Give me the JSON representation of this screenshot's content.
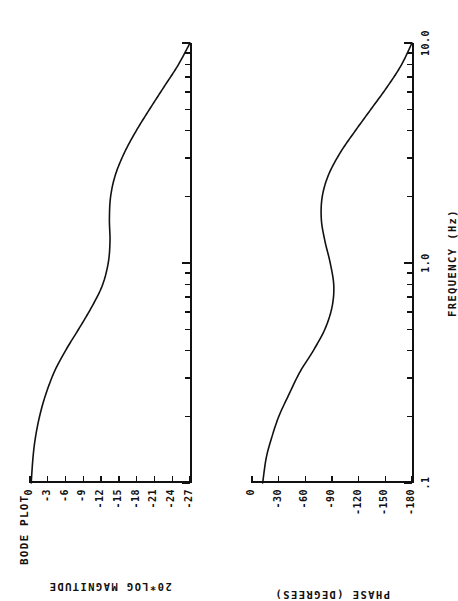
{
  "document": {
    "title": "BODE PLOT",
    "media": "dot-matrix-printout"
  },
  "axes": {
    "frequency": {
      "label": "FREQUENCY  (Hz)",
      "scale": "log",
      "tick_labels": [
        ".1",
        "1.0",
        "10.0"
      ],
      "tick_values": [
        0.1,
        1.0,
        10.0
      ],
      "range": [
        0.1,
        10.0
      ]
    },
    "magnitude": {
      "label": "20*LOG MAGNITUDE",
      "tick_labels": [
        "0",
        "-3",
        "-6",
        "-9",
        "-12",
        "-15",
        "-18",
        "-21",
        "-24",
        "-27"
      ],
      "tick_values": [
        0,
        -3,
        -6,
        -9,
        -12,
        -15,
        -18,
        -21,
        -24,
        -27
      ],
      "range": [
        0,
        -27
      ],
      "units": "dB"
    },
    "phase": {
      "label": "PHASE (DEGREES)",
      "tick_labels": [
        "0",
        "-30",
        "-60",
        "-90",
        "-120",
        "-150",
        "-180"
      ],
      "tick_values": [
        0,
        -30,
        -60,
        -90,
        -120,
        -150,
        -180
      ],
      "range": [
        0,
        -180
      ],
      "units": "degrees"
    }
  },
  "chart_data": [
    {
      "type": "line",
      "title": "BODE PLOT",
      "subtitle": "Magnitude response",
      "xlabel": "FREQUENCY  (Hz)",
      "ylabel": "20*LOG MAGNITUDE",
      "xscale": "log",
      "xlim": [
        0.1,
        10.0
      ],
      "ylim": [
        -27,
        0
      ],
      "grid": false,
      "legend": "none",
      "x": [
        0.1,
        0.13,
        0.16,
        0.2,
        0.25,
        0.32,
        0.4,
        0.5,
        0.63,
        0.79,
        1.0,
        1.26,
        1.58,
        2.0,
        2.51,
        3.16,
        3.98,
        5.01,
        6.31,
        7.94,
        10.0
      ],
      "values": [
        -0.2,
        -0.5,
        -0.9,
        -1.6,
        -2.6,
        -4.1,
        -6.0,
        -8.2,
        -10.4,
        -12.2,
        -13.2,
        -13.5,
        -13.4,
        -13.6,
        -14.4,
        -15.9,
        -17.9,
        -20.2,
        -22.6,
        -25.0,
        -27.0
      ]
    },
    {
      "type": "line",
      "title": "BODE PLOT",
      "subtitle": "Phase response",
      "xlabel": "FREQUENCY  (Hz)",
      "ylabel": "PHASE (DEGREES)",
      "xscale": "log",
      "xlim": [
        0.1,
        10.0
      ],
      "ylim": [
        -180,
        0
      ],
      "grid": false,
      "legend": "none",
      "x": [
        0.1,
        0.13,
        0.16,
        0.2,
        0.25,
        0.32,
        0.4,
        0.5,
        0.63,
        0.79,
        1.0,
        1.26,
        1.58,
        2.0,
        2.51,
        3.16,
        3.98,
        5.01,
        6.31,
        7.94,
        10.0
      ],
      "values": [
        -12,
        -16,
        -22,
        -30,
        -41,
        -54,
        -69,
        -82,
        -90,
        -92,
        -88,
        -82,
        -78,
        -79,
        -86,
        -99,
        -116,
        -134,
        -152,
        -168,
        -180
      ]
    }
  ]
}
